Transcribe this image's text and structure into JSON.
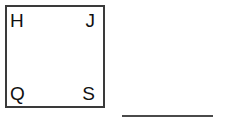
{
  "figure": {
    "type": "square-with-corner-labels",
    "square": {
      "stroke_color": "#3a3a3a",
      "fill_color": "#ffffff"
    },
    "corner_labels": {
      "top_left": "H",
      "top_right": "J",
      "bottom_left": "Q",
      "bottom_right": "S"
    },
    "answer_line": {
      "color": "#4a4a4a"
    }
  }
}
